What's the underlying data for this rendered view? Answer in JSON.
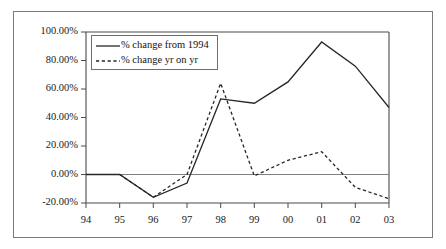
{
  "chart_data": {
    "type": "line",
    "title": "",
    "xlabel": "",
    "ylabel": "",
    "categories": [
      "94",
      "95",
      "96",
      "97",
      "98",
      "99",
      "00",
      "01",
      "02",
      "03"
    ],
    "x_tick_labels": [
      "94",
      "95",
      "96",
      "97",
      "98",
      "99",
      "00",
      "01",
      "02",
      "03"
    ],
    "y_tick_labels": [
      "100.00%",
      "80.00%",
      "60.00%",
      "40.00%",
      "20.00%",
      "0.00%",
      "-20.00%"
    ],
    "y_tick_values": [
      100,
      80,
      60,
      40,
      20,
      0,
      -20
    ],
    "ylim": [
      -20,
      100
    ],
    "grid": false,
    "legend_position": "top-left",
    "series": [
      {
        "name": "% change from 1994",
        "style": "solid",
        "color": "#262626",
        "values": [
          0,
          0,
          -16,
          -6,
          53,
          50,
          65,
          93,
          76,
          47
        ]
      },
      {
        "name": "% change yr on yr",
        "style": "dashed",
        "color": "#262626",
        "values": [
          null,
          0,
          -16,
          0,
          64,
          -1,
          10,
          16,
          -9,
          -17
        ]
      }
    ]
  },
  "legend": {
    "entries": [
      {
        "label": "% change from 1994",
        "style": "solid"
      },
      {
        "label": "% change yr on yr",
        "style": "dashed"
      }
    ]
  }
}
